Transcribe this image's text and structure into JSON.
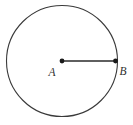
{
  "figure": {
    "type": "geometry-diagram",
    "canvas": {
      "width": 133,
      "height": 125
    },
    "background_color": "#ffffff",
    "stroke_color": "#3a3a3a",
    "line_color": "#2b2b2b",
    "point_fill_color": "#1a1a1a",
    "label_color": "#2f2f2f",
    "circle": {
      "center_x": 62,
      "center_y": 61,
      "radius": 55.5,
      "stroke_width": 1.1
    },
    "radius_segment": {
      "x1": 62,
      "y1": 61,
      "x2": 115.5,
      "y2": 61,
      "stroke_width": 1.6
    },
    "points": [
      {
        "id": "A",
        "label": "A",
        "cx": 62,
        "cy": 61,
        "r": 2.4,
        "label_x": 52,
        "label_y": 76,
        "label_font_size": 11.5,
        "role": "center"
      },
      {
        "id": "B",
        "label": "B",
        "cx": 115.5,
        "cy": 61,
        "r": 2.4,
        "label_x": 119,
        "label_y": 75,
        "label_font_size": 11.5,
        "role": "on-circle"
      }
    ]
  }
}
